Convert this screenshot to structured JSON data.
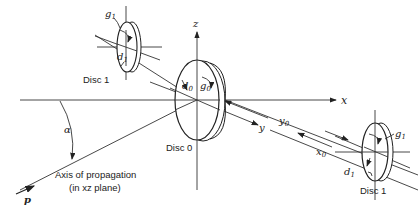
{
  "figure": {
    "type": "geometry diagram",
    "axes": {
      "x": "x",
      "y": "y",
      "z": "z"
    },
    "discs": [
      {
        "name": "Disc 1",
        "position": "upper-left",
        "labels": [
          "g1",
          "d1"
        ]
      },
      {
        "name": "Disc 0",
        "position": "origin",
        "labels": [
          "d0",
          "g0"
        ]
      },
      {
        "name": "Disc 1",
        "position": "lower-right",
        "labels": [
          "g1",
          "d1"
        ]
      }
    ],
    "dimensions": {
      "y0": "y0",
      "x0": "x0"
    },
    "angle": "α",
    "vector": "p",
    "propagation_label_line1": "Axis of propagation",
    "propagation_label_line2": "(in xz plane)"
  },
  "labels": {
    "disc1_top": "Disc 1",
    "disc0": "Disc 0",
    "disc1_bottom": "Disc 1",
    "g1_top": "g",
    "g1_top_sub": "1",
    "d1_top": "d",
    "d1_top_sub": "1",
    "d0": "d",
    "d0_sub": "0",
    "g0": "g",
    "g0_sub": "0",
    "g1_bot": "g",
    "g1_bot_sub": "1",
    "d1_bot": "d",
    "d1_bot_sub": "1",
    "axis_x": "x",
    "axis_y": "y",
    "axis_z": "z",
    "y0": "y",
    "y0_sub": "0",
    "x0": "x",
    "x0_sub": "0",
    "alpha": "α",
    "p": "p",
    "prop1": "Axis of propagation",
    "prop2": "(in xz plane)"
  }
}
